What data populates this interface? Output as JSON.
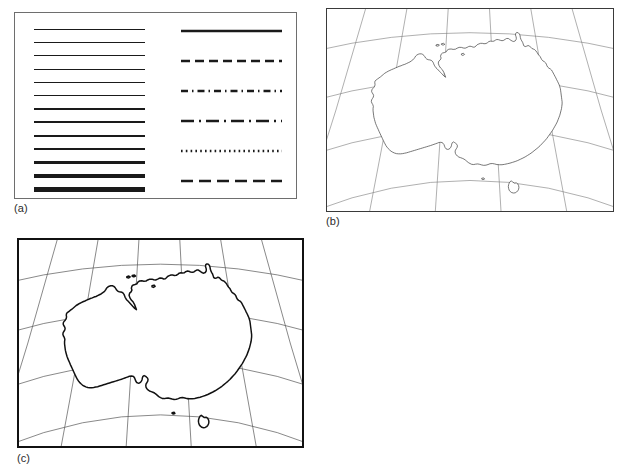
{
  "figure": {
    "caption_style": "lowercase-parenthetical",
    "background_color": "#ffffff",
    "ink_color": "#1a1a1a"
  },
  "panels": [
    {
      "id": "a",
      "label": "(a)",
      "kind": "line-specimen-chart",
      "border_color": "#6e6e6e",
      "border_width_px": 1
    },
    {
      "id": "b",
      "label": "(b)",
      "kind": "map-australia-thin",
      "border_color": "#3a3a3a",
      "border_width_px": 1
    },
    {
      "id": "c",
      "label": "(c)",
      "kind": "map-australia-thick",
      "border_color": "#111111",
      "border_width_px": 2
    }
  ],
  "line_weights": {
    "title": "",
    "count": 13,
    "color": "#1a1a1a",
    "unit": "px",
    "values": [
      0.5,
      0.7,
      0.9,
      1.0,
      1.2,
      1.4,
      1.7,
      2.0,
      2.3,
      2.7,
      3.1,
      3.6,
      4.2
    ],
    "row_spacing_px": 13.2
  },
  "line_styles": {
    "count": 6,
    "color": "#1a1a1a",
    "stroke_width_px": 2.4,
    "items": [
      {
        "name": "solid",
        "dash": "none",
        "y_px": 2
      },
      {
        "name": "dashed",
        "dash": "9 5",
        "y_px": 32
      },
      {
        "name": "dash-dot-fine",
        "dash": "7 4 1.5 4",
        "y_px": 62
      },
      {
        "name": "long-dash-dot",
        "dash": "13 5 2 5",
        "y_px": 92
      },
      {
        "name": "dotted",
        "dash": "1.6 3.2",
        "y_px": 122
      },
      {
        "name": "long-dashed",
        "dash": "12 6",
        "y_px": 152
      }
    ]
  },
  "map": {
    "subject": "Australia",
    "graticule": {
      "meridian_count": 6,
      "parallel_count": 4,
      "curved": true,
      "thin_color": "#7a7a7a",
      "thin_width_px": 0.6,
      "thick_color": "#555555",
      "thick_width_px": 0.7
    },
    "coastline": {
      "thin_color": "#3c3c3c",
      "thin_width_px": 0.7,
      "thick_color": "#111111",
      "thick_width_px": 1.5,
      "includes_tasmania": true
    }
  },
  "chart_data": {
    "type": "line",
    "title": "",
    "subtitle": "",
    "xlabel": "",
    "ylabel": "",
    "legend_position": "none",
    "grid": false,
    "panels": [
      {
        "panel": "(a)",
        "description": "Line weight and line style specimen sheet",
        "series": [
          {
            "name": "line-weights",
            "values": [
              0.5,
              0.7,
              0.9,
              1.0,
              1.2,
              1.4,
              1.7,
              2.0,
              2.3,
              2.7,
              3.1,
              3.6,
              4.2
            ]
          },
          {
            "name": "line-styles",
            "values": [
              "solid",
              "dashed",
              "dash-dot-fine",
              "long-dash-dot",
              "dotted",
              "long-dashed"
            ]
          }
        ]
      },
      {
        "panel": "(b)",
        "description": "Australia coastline with graticule, fine line weight"
      },
      {
        "panel": "(c)",
        "description": "Australia coastline with graticule, heavy line weight"
      }
    ]
  }
}
